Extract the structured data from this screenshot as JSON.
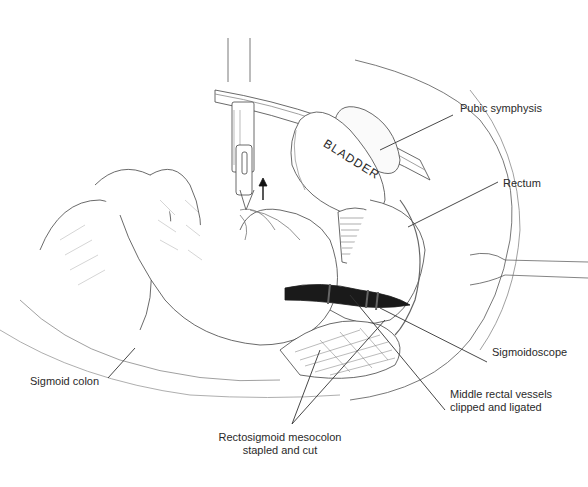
{
  "figure": {
    "type": "surgical illustration",
    "organ_label": "BLADDER",
    "labels": [
      {
        "id": "pubic-symphysis",
        "text": "Pubic symphysis"
      },
      {
        "id": "rectum",
        "text": "Rectum"
      },
      {
        "id": "sigmoidoscope",
        "text": "Sigmoidoscope"
      },
      {
        "id": "middle-rectal-vessels",
        "line1": "Middle rectal vessels",
        "line2": "clipped and ligated"
      },
      {
        "id": "rectosigmoid-mesocolon",
        "line1": "Rectosigmoid mesocolon",
        "line2": "stapled and cut"
      },
      {
        "id": "sigmoid-colon",
        "text": "Sigmoid colon"
      }
    ],
    "colors": {
      "line": "#333333",
      "hatch": "#555555",
      "dark": "#1a1a1a",
      "background": "#ffffff"
    }
  }
}
